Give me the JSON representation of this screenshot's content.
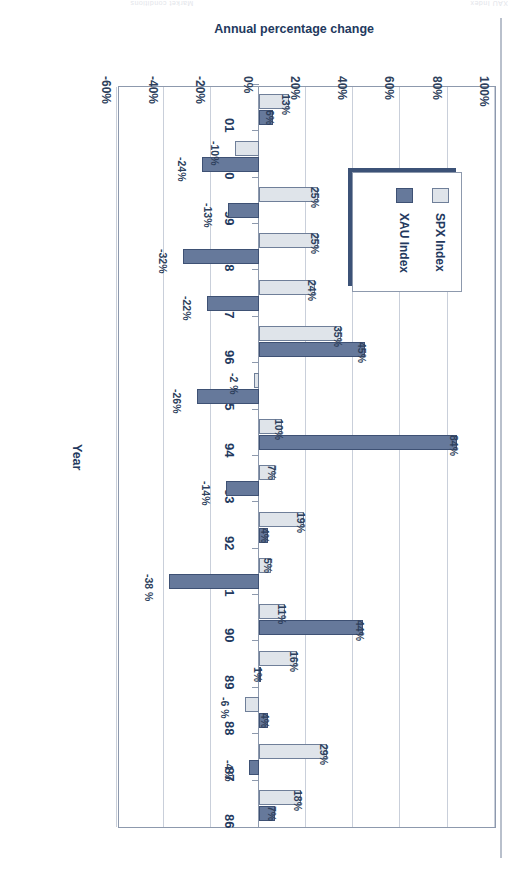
{
  "page": {
    "header_left": "Market conditions",
    "header_right": "XAU Index"
  },
  "chart_data": {
    "type": "bar",
    "orientation": "horizontal",
    "title": "",
    "xlabel": "Annual percentage change",
    "ylabel": "Year",
    "categories": [
      "86",
      "87",
      "88",
      "89",
      "90",
      "91",
      "92",
      "93",
      "94",
      "95",
      "96",
      "97",
      "98",
      "99",
      "00",
      "01"
    ],
    "xlim": [
      -60,
      100
    ],
    "xticks": [
      "100%",
      "80%",
      "60%",
      "40%",
      "20%",
      "0%",
      "-20%",
      "-40%",
      "-60%"
    ],
    "xtick_values": [
      100,
      80,
      60,
      40,
      20,
      0,
      -20,
      -40,
      -60
    ],
    "grid": true,
    "legend_position": "upper-left",
    "series": [
      {
        "name": "SPX Index",
        "color": "#dfe4ea",
        "values": [
          18,
          29,
          -6,
          16,
          11,
          5,
          19,
          7,
          10,
          -2,
          35,
          24,
          25,
          25,
          -10,
          13
        ],
        "labels": [
          "18%",
          "29%",
          "-6 %",
          "16%",
          "11%",
          "5%",
          "19%",
          "7%",
          "10%",
          "-2 %",
          "35%",
          "24%",
          "25%",
          "25%",
          "-10%",
          "13%"
        ]
      },
      {
        "name": "XAU Index",
        "color": "#66799b",
        "values": [
          7,
          -4,
          4,
          1,
          44,
          -38,
          4,
          -14,
          84,
          -26,
          45,
          -22,
          -32,
          -13,
          -24,
          6
        ],
        "labels": [
          "7%",
          "-4 %",
          "4%",
          "1%",
          "44%",
          "-38 %",
          "4%",
          "-14%",
          "84%",
          "-26%",
          "45%",
          "-22%",
          "-32%",
          "-13%",
          "-24%",
          "6%"
        ]
      }
    ]
  }
}
